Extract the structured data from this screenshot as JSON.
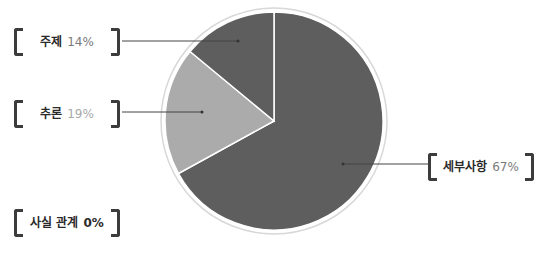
{
  "chart_data": {
    "type": "pie",
    "title": "",
    "categories": [
      "세부사항",
      "추론",
      "주제",
      "사실 관계"
    ],
    "values": [
      67,
      19,
      14,
      0
    ],
    "unit": "%",
    "colors": [
      "#5e5e5e",
      "#ababab",
      "#5e5e5e",
      "#5e5e5e"
    ],
    "start_angle_deg": 0,
    "direction": "clockwise",
    "legend_position": "callout labels"
  },
  "labels": {
    "detail": {
      "name": "세부사항",
      "pct": "67%"
    },
    "inference": {
      "name": "추론",
      "pct": "19%"
    },
    "topic": {
      "name": "주제",
      "pct": "14%"
    },
    "fact": {
      "name": "사실 관계",
      "pct": "0%"
    }
  }
}
